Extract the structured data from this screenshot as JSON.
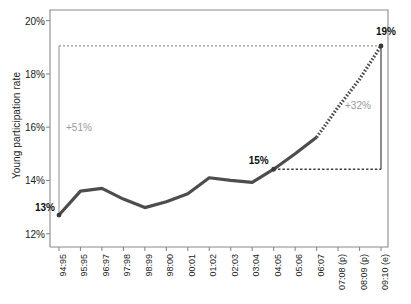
{
  "chart_data": {
    "type": "line",
    "title": "",
    "xlabel": "",
    "ylabel": "Young participation rate",
    "ylim": [
      11.5,
      20.4
    ],
    "yticks": [
      12,
      14,
      16,
      18,
      20
    ],
    "ytick_labels": [
      "12%",
      "14%",
      "16%",
      "18%",
      "20%"
    ],
    "grid": false,
    "legend": null,
    "categories": [
      "94:95",
      "95:95",
      "96:97",
      "97:98",
      "98:99",
      "98:00",
      "00:01",
      "01:02",
      "02:03",
      "03:04",
      "04:05",
      "05:06",
      "06:07",
      "07:08 (p)",
      "08:09 (p)",
      "09:10 (e)"
    ],
    "series": [
      {
        "name": "Young participation rate",
        "style": "solid",
        "color": "#4d4d4d",
        "values": [
          12.7,
          13.6,
          13.7,
          13.3,
          12.98,
          13.2,
          13.5,
          14.1,
          14.0,
          13.93,
          14.42,
          15.0,
          15.62,
          null,
          null,
          null
        ]
      },
      {
        "name": "Projection",
        "style": "dotted",
        "color": "#4d4d4d",
        "values": [
          null,
          null,
          null,
          null,
          null,
          null,
          null,
          null,
          null,
          null,
          null,
          null,
          15.62,
          16.75,
          17.8,
          19.05
        ]
      }
    ],
    "point_labels": [
      {
        "text": "13%",
        "category": "94:95",
        "value": 12.7
      },
      {
        "text": "15%",
        "category": "04:05",
        "value": 14.42
      },
      {
        "text": "19%",
        "category": "09:10 (e)",
        "value": 19.05
      }
    ],
    "annotations": [
      {
        "text": "+51%",
        "from_category": "94:95",
        "to_category": "09:10 (e)",
        "from_value": 12.7,
        "to_value": 19.05,
        "bracket_top": 19.05,
        "color": "#9a9a9a"
      },
      {
        "text": "+32%",
        "from_category": "04:05",
        "to_category": "09:10 (e)",
        "from_value": 14.42,
        "to_value": 19.05,
        "bracket_bottom": 14.42,
        "color": "#9a9a9a"
      }
    ]
  },
  "colors": {
    "line": "#4d4d4d",
    "axis": "#8a8a8a",
    "annotation": "#9a9a9a",
    "text": "#1b1b1b",
    "background": "#ffffff"
  }
}
